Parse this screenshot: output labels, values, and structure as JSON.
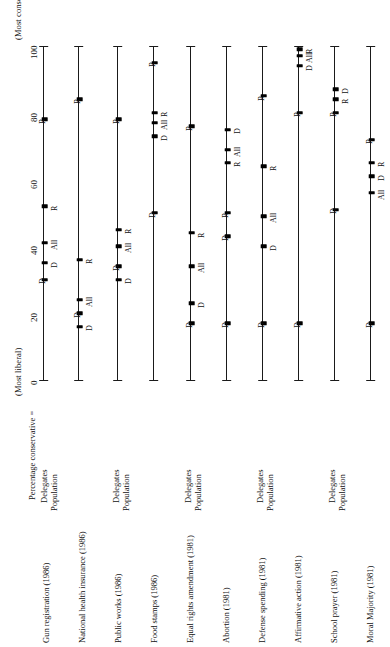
{
  "figure": {
    "axis_title": "Percentage conservative =",
    "most_conservative_note": "(Most conservative)",
    "most_liberal_note": "(Most liberal)",
    "tick_labels": [
      "0",
      "20",
      "40",
      "60",
      "80",
      "100"
    ],
    "group_labels": [
      "Delegates",
      "Population"
    ]
  },
  "chart_data": {
    "type": "scatter",
    "title": "Percentage conservative =",
    "xlabel": "",
    "ylabel": "Percentage conservative",
    "ylim": [
      0,
      100
    ],
    "ticks": [
      0,
      20,
      40,
      60,
      80,
      100
    ],
    "grid": false,
    "axis_annotations": {
      "low_end": "(Most liberal)",
      "high_end": "(Most conservative)"
    },
    "point_series": [
      "D",
      "All",
      "R"
    ],
    "issues": [
      {
        "label": "Gun registration (1986)",
        "rows": [
          {
            "group": "Delegates",
            "points": [
              {
                "series": "D",
                "value": 30
              },
              {
                "series": "All",
                "value": 35
              },
              {
                "series": "D",
                "value": 41
              },
              {
                "series": "R",
                "value": 52
              },
              {
                "series": "R",
                "value": 78
              }
            ]
          },
          {
            "group": "Population",
            "points": [
              {
                "series": "R",
                "value": 84
              }
            ]
          }
        ]
      },
      {
        "label": "National health insurance (1986)",
        "rows": [
          {
            "group": "Delegates",
            "points": [
              {
                "series": "D",
                "value": 18
              },
              {
                "series": "All",
                "value": 24
              },
              {
                "series": "R",
                "value": 36
              }
            ]
          },
          {
            "group": "Population",
            "points": [
              {
                "series": "R",
                "value": 78
              }
            ]
          }
        ]
      },
      {
        "label": "Public works (1986)",
        "rows": [
          {
            "group": "Delegates",
            "points": [
              {
                "series": "D",
                "value": 30
              },
              {
                "series": "All",
                "value": 34
              },
              {
                "series": "R",
                "value": 40
              },
              {
                "series": "R",
                "value": 45
              }
            ]
          },
          {
            "group": "Population",
            "points": [
              {
                "series": "D",
                "value": 50
              },
              {
                "series": "D",
                "value": 73
              },
              {
                "series": "All",
                "value": 77
              },
              {
                "series": "R",
                "value": 80
              },
              {
                "series": "R",
                "value": 95
              }
            ]
          }
        ]
      },
      {
        "label": "Food stamps (1986)",
        "rows": [
          {
            "group": "Delegates",
            "points": [
              {
                "series": "D",
                "value": 23
              },
              {
                "series": "All",
                "value": 34
              },
              {
                "series": "R",
                "value": 44
              },
              {
                "series": "R",
                "value": 76
              }
            ]
          },
          {
            "group": "Population",
            "points": [
              {
                "series": "D",
                "value": 43
              },
              {
                "series": "R",
                "value": 50
              },
              {
                "series": "R",
                "value": 65
              },
              {
                "series": "All",
                "value": 69
              },
              {
                "series": "D",
                "value": 75
              }
            ]
          }
        ]
      },
      {
        "label": "Equal rights amendment (1981)",
        "rows": [
          {
            "group": "Delegates",
            "points": [
              {
                "series": "D",
                "value": 17
              },
              {
                "series": "D",
                "value": 40
              },
              {
                "series": "All",
                "value": 49
              },
              {
                "series": "R",
                "value": 64
              },
              {
                "series": "R",
                "value": 85
              }
            ]
          },
          {
            "group": "Population",
            "points": []
          }
        ]
      },
      {
        "label": "Abortion (1981)",
        "rows": [
          {
            "group": "Delegates",
            "points": [
              {
                "series": "D",
                "value": 17
              }
            ]
          },
          {
            "group": "Population",
            "points": [
              {
                "series": "R",
                "value": 78
              }
            ]
          }
        ]
      },
      {
        "label": "Defense spending (1981)",
        "rows": [
          {
            "group": "Delegates",
            "points": [
              {
                "series": "D",
                "value": 18
              },
              {
                "series": "D",
                "value": 51
              },
              {
                "series": "R",
                "value": 80
              }
            ]
          },
          {
            "group": "Population",
            "points": []
          }
        ]
      },
      {
        "label": "Affirmative action (1981)",
        "rows": [
          {
            "group": "Delegates",
            "points": [
              {
                "series": "D",
                "value": 17
              },
              {
                "series": "R",
                "value": 80
              },
              {
                "series": "D",
                "value": 94
              },
              {
                "series": "All",
                "value": 97
              },
              {
                "series": "R",
                "value": 99
              }
            ]
          },
          {
            "group": "Population",
            "points": [
              {
                "series": "R",
                "value": 80
              },
              {
                "series": "R",
                "value": 84
              },
              {
                "series": "D",
                "value": 87
              }
            ]
          }
        ]
      },
      {
        "label": "School prayer (1981)",
        "rows": [
          {
            "group": "Delegates",
            "points": []
          },
          {
            "group": "Population",
            "points": []
          }
        ]
      },
      {
        "label": "Moral Majority (1981)",
        "rows": [
          {
            "group": "Delegates",
            "points": [
              {
                "series": "D",
                "value": 17
              },
              {
                "series": "All",
                "value": 56
              },
              {
                "series": "D",
                "value": 61
              },
              {
                "series": "R",
                "value": 65
              },
              {
                "series": "R",
                "value": 72
              }
            ]
          },
          {
            "group": "Population",
            "points": []
          }
        ]
      }
    ]
  },
  "lines": [
    {
      "x": 43,
      "points": [
        {
          "v": 30,
          "lab": "D",
          "side": "left"
        },
        {
          "v": 35,
          "lab": "D",
          "side": "right"
        },
        {
          "v": 41,
          "lab": "All",
          "side": "right"
        },
        {
          "v": 52,
          "lab": "R",
          "side": "right"
        },
        {
          "v": 78,
          "lab": "R",
          "side": "left"
        }
      ]
    },
    {
      "x": 78,
      "points": [
        {
          "v": 84,
          "lab": "R",
          "side": "left"
        },
        {
          "v": 36,
          "lab": "R",
          "side": "right"
        },
        {
          "v": 24,
          "lab": "All",
          "side": "right"
        },
        {
          "v": 20,
          "lab": "D",
          "side": "left"
        },
        {
          "v": 16,
          "lab": "D",
          "side": "right"
        }
      ]
    },
    {
      "x": 117,
      "points": [
        {
          "v": 78,
          "lab": "R",
          "side": "left"
        },
        {
          "v": 45,
          "lab": "R",
          "side": "right"
        },
        {
          "v": 40,
          "lab": "All",
          "side": "right"
        },
        {
          "v": 34,
          "lab": "D",
          "side": "left"
        },
        {
          "v": 30,
          "lab": "D",
          "side": "right"
        }
      ]
    },
    {
      "x": 153,
      "points": [
        {
          "v": 95,
          "lab": "R",
          "side": "left"
        },
        {
          "v": 80,
          "lab": "R",
          "side": "right"
        },
        {
          "v": 77,
          "lab": "All",
          "side": "right"
        },
        {
          "v": 73,
          "lab": "D",
          "side": "right"
        },
        {
          "v": 50,
          "lab": "D",
          "side": "left"
        }
      ]
    },
    {
      "x": 190,
      "points": [
        {
          "v": 76,
          "lab": "R",
          "side": "left"
        },
        {
          "v": 44,
          "lab": "R",
          "side": "right"
        },
        {
          "v": 34,
          "lab": "All",
          "side": "right"
        },
        {
          "v": 23,
          "lab": "D",
          "side": "right"
        },
        {
          "v": 17,
          "lab": "D",
          "side": "left"
        }
      ]
    },
    {
      "x": 226,
      "points": [
        {
          "v": 75,
          "lab": "D",
          "side": "right"
        },
        {
          "v": 69,
          "lab": "All",
          "side": "right"
        },
        {
          "v": 65,
          "lab": "R",
          "side": "right"
        },
        {
          "v": 50,
          "lab": "R",
          "side": "left"
        },
        {
          "v": 43,
          "lab": "D",
          "side": "left"
        },
        {
          "v": 17,
          "lab": "D",
          "side": "left"
        }
      ]
    },
    {
      "x": 262,
      "points": [
        {
          "v": 85,
          "lab": "R",
          "side": "left"
        },
        {
          "v": 64,
          "lab": "R",
          "side": "right"
        },
        {
          "v": 49,
          "lab": "All",
          "side": "right"
        },
        {
          "v": 40,
          "lab": "D",
          "side": "right"
        },
        {
          "v": 17,
          "lab": "D",
          "side": "left"
        }
      ]
    },
    {
      "x": 298,
      "points": [
        {
          "v": 99,
          "lab": "R",
          "side": "right"
        },
        {
          "v": 97,
          "lab": "All",
          "side": "right"
        },
        {
          "v": 94,
          "lab": "D",
          "side": "right"
        },
        {
          "v": 80,
          "lab": "R",
          "side": "left"
        },
        {
          "v": 17,
          "lab": "D",
          "side": "left"
        }
      ]
    },
    {
      "x": 334,
      "points": [
        {
          "v": 87,
          "lab": "D",
          "side": "right"
        },
        {
          "v": 84,
          "lab": "R",
          "side": "right"
        },
        {
          "v": 80,
          "lab": "R",
          "side": "left"
        },
        {
          "v": 51,
          "lab": "D",
          "side": "left"
        }
      ]
    },
    {
      "x": 370,
      "points": [
        {
          "v": 72,
          "lab": "R",
          "side": "left"
        },
        {
          "v": 65,
          "lab": "R",
          "side": "right"
        },
        {
          "v": 61,
          "lab": "D",
          "side": "right"
        },
        {
          "v": 56,
          "lab": "All",
          "side": "right"
        },
        {
          "v": 17,
          "lab": "D",
          "side": "left"
        }
      ]
    }
  ],
  "row_label_positions": [
    {
      "label": "Gun registration (1986)",
      "x": 42,
      "y": 643
    },
    {
      "label": "National health insurance (1986)",
      "x": 78,
      "y": 643
    },
    {
      "label": "Public works (1986)",
      "x": 114,
      "y": 643
    },
    {
      "label": "Food stamps (1986)",
      "x": 150,
      "y": 643
    },
    {
      "label": "Equal rights amendment (1981)",
      "x": 186,
      "y": 643
    },
    {
      "label": "Abortion (1981)",
      "x": 222,
      "y": 643
    },
    {
      "label": "Defense spending (1981)",
      "x": 258,
      "y": 643
    },
    {
      "label": "Affirmative action (1981)",
      "x": 294,
      "y": 643
    },
    {
      "label": "School prayer (1981)",
      "x": 330,
      "y": 643
    },
    {
      "label": "Moral Majority (1981)",
      "x": 366,
      "y": 643
    }
  ],
  "group_label_positions": [
    {
      "label": "Delegates",
      "x": 40,
      "y": 503
    },
    {
      "label": "Population",
      "x": 50,
      "y": 511
    },
    {
      "label": "Delegates",
      "x": 112,
      "y": 503
    },
    {
      "label": "Population",
      "x": 122,
      "y": 511
    },
    {
      "label": "Delegates",
      "x": 184,
      "y": 503
    },
    {
      "label": "Population",
      "x": 194,
      "y": 511
    },
    {
      "label": "Delegates",
      "x": 256,
      "y": 503
    },
    {
      "label": "Population",
      "x": 266,
      "y": 511
    },
    {
      "label": "Delegates",
      "x": 328,
      "y": 503
    },
    {
      "label": "Population",
      "x": 338,
      "y": 511
    }
  ]
}
